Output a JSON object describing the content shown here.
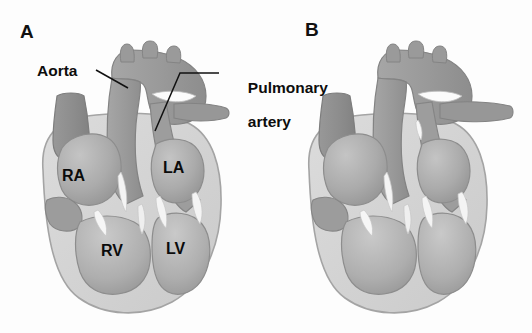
{
  "figure": {
    "background_color": "#fdfdfd",
    "panels": [
      {
        "letter": "A",
        "labelled": true,
        "callouts": [
          {
            "text": "Aorta",
            "target": "aortic-arch"
          },
          {
            "text": "Pulmonary\nartery",
            "target": "pulmonary-trunk"
          }
        ],
        "chambers": [
          {
            "abbr": "RA",
            "name": "right-atrium"
          },
          {
            "abbr": "RV",
            "name": "right-ventricle"
          },
          {
            "abbr": "LA",
            "name": "left-atrium"
          },
          {
            "abbr": "LV",
            "name": "left-ventricle"
          }
        ]
      },
      {
        "letter": "B",
        "labelled": false,
        "callouts": [],
        "chambers": []
      }
    ]
  },
  "callout_text": {
    "aorta": "Aorta",
    "pulmonary_line1": "Pulmonary",
    "pulmonary_line2": "artery"
  },
  "chamber_text": {
    "ra": "RA",
    "rv": "RV",
    "la": "LA",
    "lv": "LV"
  },
  "panel_letters": {
    "a": "A",
    "b": "B"
  },
  "colors": {
    "background": "#fdfdfd",
    "myocardium_wall": "#d2d2d2",
    "myocardium_wall_edge": "#a8a8a8",
    "chamber_fill": "#b0b0b0",
    "chamber_fill_dark": "#9a9a9a",
    "great_vessel": "#9b9b9b",
    "great_vessel_dark": "#8a8a8a",
    "vena_cava": "#8f8f8f",
    "valve_highlight": "#f2f2f2",
    "outline": "#6e6e6e",
    "label_text": "#0b0b0b",
    "leader_line": "#111111"
  }
}
